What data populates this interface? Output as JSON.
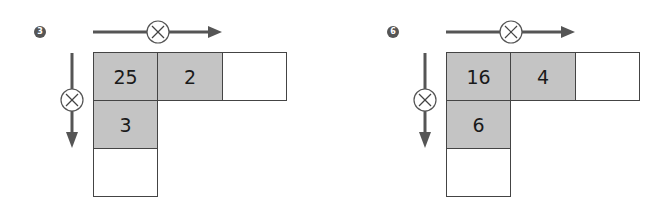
{
  "colors": {
    "arrow": "#555555",
    "badge": "#555555",
    "filled_cell": "#c4c4c4",
    "empty_cell": "#ffffff",
    "border": "#444444"
  },
  "operator_symbol": "×",
  "problems": [
    {
      "number": "3",
      "row_operator": "×",
      "column_operator": "×",
      "grid": {
        "top_left": "25",
        "top_middle": "2",
        "top_right": "",
        "middle_left": "3",
        "bottom_left": ""
      }
    },
    {
      "number": "6",
      "row_operator": "×",
      "column_operator": "×",
      "grid": {
        "top_left": "16",
        "top_middle": "4",
        "top_right": "",
        "middle_left": "6",
        "bottom_left": ""
      }
    }
  ]
}
